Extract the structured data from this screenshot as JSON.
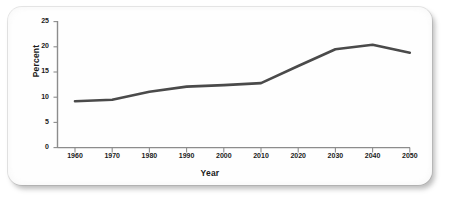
{
  "chart_data": {
    "type": "line",
    "title": "",
    "xlabel": "Year",
    "ylabel": "Percent",
    "x": [
      1960,
      1970,
      1980,
      1990,
      2000,
      2010,
      2020,
      2030,
      2040,
      2050
    ],
    "values": [
      9.2,
      9.5,
      11.1,
      12.1,
      12.4,
      12.8,
      16.2,
      19.5,
      20.4,
      18.8
    ],
    "series": [
      {
        "name": "Percent",
        "values": [
          9.2,
          9.5,
          11.1,
          12.1,
          12.4,
          12.8,
          16.2,
          19.5,
          20.4,
          18.8
        ]
      }
    ],
    "xticklabels": [
      "1960",
      "1970",
      "1980",
      "1990",
      "2000",
      "2010",
      "2020",
      "2030",
      "2040",
      "2050"
    ],
    "yticklabels": [
      "0",
      "5",
      "10",
      "15",
      "20",
      "25"
    ],
    "yticks": [
      0,
      5,
      10,
      15,
      20,
      25
    ],
    "ylim": [
      0,
      25
    ],
    "xlim": [
      1960,
      2050
    ],
    "grid": false,
    "legend": false,
    "line_color": "#4a4a4a",
    "axis_color": "#8c8c8c",
    "text_color": "#1a1a1a",
    "background": "#fefefe"
  }
}
